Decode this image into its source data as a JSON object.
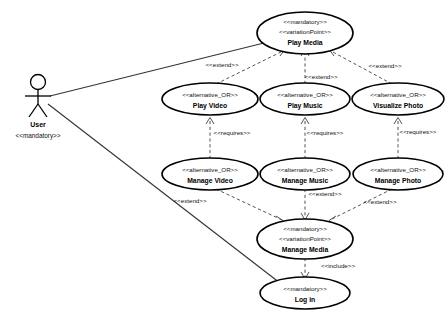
{
  "diagram": {
    "type": "uml-use-case-diagram",
    "background_color": "#ffffff",
    "line_color": "#000000",
    "dependency_color": "#555555"
  },
  "actor": {
    "name": "User",
    "stereotype": "<<mandatory>>",
    "icon": "stick-figure-actor"
  },
  "use_cases": {
    "play_media": {
      "stereotype_1": "<<mandatory>>",
      "stereotype_2": "<<variationPoint>>",
      "name": "Play Media"
    },
    "play_video": {
      "stereotype_1": "<<alternative_OR>>",
      "name": "Play Video"
    },
    "play_music": {
      "stereotype_1": "<<alternative_OR>>",
      "name": "Play Music"
    },
    "visualize_photo": {
      "stereotype_1": "<<alternative_OR>>",
      "name": "Visualize Photo"
    },
    "manage_video": {
      "stereotype_1": "<<alternative_OR>>",
      "name": "Manage Video"
    },
    "manage_music": {
      "stereotype_1": "<<alternative_OR>>",
      "name": "Manage Music"
    },
    "manage_photo": {
      "stereotype_1": "<<alternative_OR>>",
      "name": "Manage Photo"
    },
    "manage_media": {
      "stereotype_1": "<<mandatory>>",
      "stereotype_2": "<<variationPoint>>",
      "name": "Manage Media"
    },
    "log_in": {
      "stereotype_1": "<<mandatory>>",
      "name": "Log in"
    }
  },
  "relationships": {
    "extend_play_video": "<<extend>>",
    "extend_play_music": "<<extend>>",
    "extend_visualize_photo": "<<extend>>",
    "requires_video": "<<requires>>",
    "requires_music": "<<requires>>",
    "requires_photo": "<<requires>>",
    "extend_manage_video": "<<extend>>",
    "extend_manage_music": "<<extend>>",
    "extend_manage_photo": "<<extend>>",
    "include_log_in": "<<include>>"
  }
}
